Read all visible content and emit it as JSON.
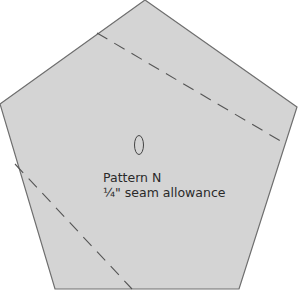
{
  "diagram": {
    "shape": "pentagon",
    "fill_color": "#d4d4d4",
    "stroke_color": "#6e6e6e",
    "dash_color": "#555555",
    "vertices": [
      [
        145,
        0
      ],
      [
        297,
        107
      ],
      [
        239,
        289
      ],
      [
        55,
        289
      ],
      [
        0,
        104
      ]
    ],
    "dashed_lines": [
      {
        "from": [
          97,
          33
        ],
        "to": [
          284,
          143
        ]
      },
      {
        "from": [
          15,
          164
        ],
        "to": [
          132,
          289
        ]
      }
    ],
    "grain_marker": {
      "shape": "oval",
      "cx": 139,
      "cy": 145,
      "rx": 5,
      "ry": 10
    }
  },
  "labels": {
    "pattern_name": "Pattern N",
    "seam_allowance": "¼\" seam allowance"
  }
}
